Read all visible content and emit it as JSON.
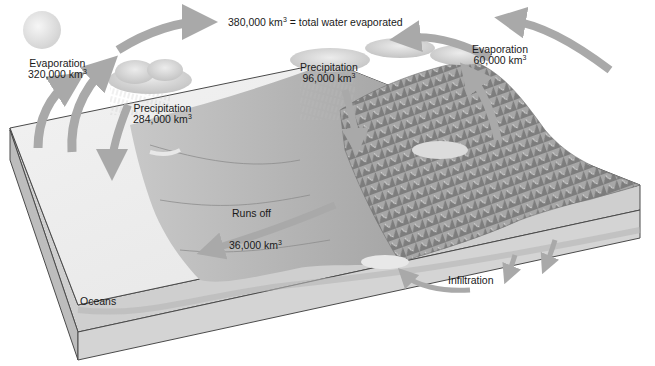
{
  "diagram": {
    "type": "water-cycle-block-diagram",
    "colors": {
      "background": "#ffffff",
      "arrow": "#a9a9a9",
      "ocean_surface": "#ececec",
      "land": "#b9b9b9",
      "mountains": "#8f8f8f",
      "block_side": "#cfcfcf",
      "outline": "#4a4a4a",
      "cloud": "#d6d6d6",
      "sun": "#e6e6e6"
    },
    "labels": {
      "total": {
        "value": "380,000 km",
        "unit_sup": "3",
        "suffix": " = total water evaporated"
      },
      "ocean_evaporation": {
        "title": "Evaporation",
        "value": "320,000 km",
        "unit_sup": "3"
      },
      "ocean_precipitation": {
        "title": "Precipitation",
        "value": "284,000 km",
        "unit_sup": "3"
      },
      "land_precipitation": {
        "title": "Precipitation",
        "value": "96,000 km",
        "unit_sup": "3"
      },
      "land_evaporation": {
        "title": "Evaporation",
        "value": "60,000 km",
        "unit_sup": "3"
      },
      "runoff": {
        "title": "Runs off",
        "value": "36,000 km",
        "unit_sup": "3"
      },
      "infiltration": {
        "title": "Infiltration"
      },
      "oceans": {
        "title": "Oceans"
      }
    },
    "flows": [
      {
        "from": "oceans",
        "to": "atmosphere",
        "label": "Evaporation",
        "amount_km3": 320000
      },
      {
        "from": "atmosphere",
        "to": "oceans",
        "label": "Precipitation",
        "amount_km3": 284000
      },
      {
        "from": "atmosphere",
        "to": "land",
        "label": "Precipitation",
        "amount_km3": 96000
      },
      {
        "from": "land",
        "to": "atmosphere",
        "label": "Evaporation",
        "amount_km3": 60000
      },
      {
        "from": "land",
        "to": "oceans",
        "label": "Runs off",
        "amount_km3": 36000
      },
      {
        "from": "land",
        "to": "groundwater",
        "label": "Infiltration"
      },
      {
        "from": "atmosphere",
        "to": "atmosphere",
        "label": "total water evaporated",
        "amount_km3": 380000
      }
    ]
  }
}
